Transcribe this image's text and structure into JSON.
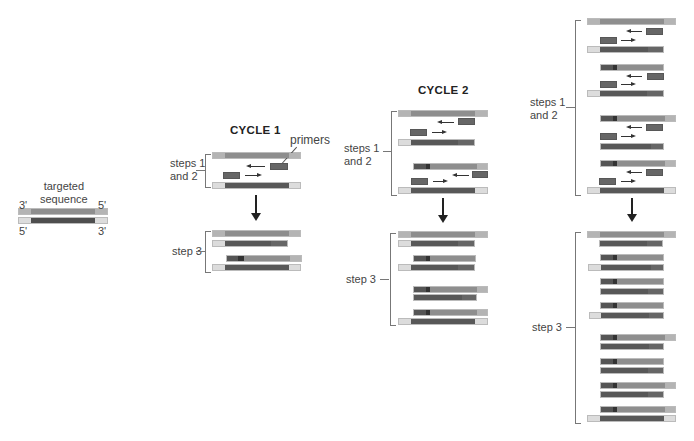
{
  "colors": {
    "flank_top": "#b4b4b4",
    "flank_bottom": "#dcdcdc",
    "template_top": "#8e8e8e",
    "template_bottom": "#585858",
    "primer": "#666666",
    "primer_core": "#333333"
  },
  "labels": {
    "targeted_sequence": "targeted\nsequence",
    "end_3_top": "3'",
    "end_5_top": "5'",
    "end_5_bottom": "5'",
    "end_3_bottom": "3'",
    "primers": "primers"
  },
  "cycles": [
    {
      "title": "CYCLE 1",
      "steps_1_2": "steps 1\nand 2",
      "step_3": "step 3"
    },
    {
      "title": "CYCLE 2",
      "steps_1_2": "steps 1\nand 2",
      "step_3": "step 3"
    },
    {
      "title": "",
      "steps_1_2": "steps 1\nand 2",
      "step_3": "step 3"
    }
  ]
}
